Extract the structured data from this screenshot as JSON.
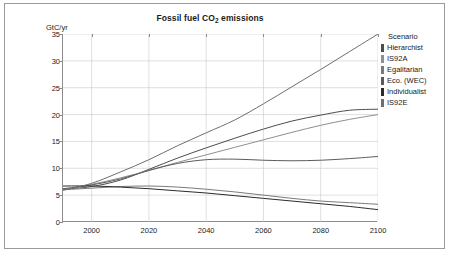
{
  "panel": {
    "border_color": "#9a9a9a",
    "background": "#ffffff"
  },
  "title": "Fossil fuel CO2 emissions",
  "title_main": "Fossil fuel CO",
  "title_sub": "2",
  "title_tail": " emissions",
  "ylabel": "GtC/yr",
  "legend": {
    "header": "Scenario",
    "items": [
      {
        "label": "Hierarchist",
        "color": "#4d4d4d"
      },
      {
        "label": "IS92A",
        "color": "#8f8f8f"
      },
      {
        "label": "Egalitarian",
        "color": "#7a7a7a"
      },
      {
        "label": "Eco. (WEC)",
        "color": "#5c5c5c"
      },
      {
        "label": "Individualist",
        "color": "#2b2b2b"
      },
      {
        "label": "IS92E",
        "color": "#6e6e6e"
      }
    ]
  },
  "chart_data": {
    "type": "line",
    "title": "Fossil fuel CO2 emissions",
    "xlabel": "",
    "ylabel": "GtC/yr",
    "xlim": [
      1990,
      2100
    ],
    "ylim": [
      0,
      35
    ],
    "grid": true,
    "legend_position": "right",
    "legend_title": "Scenario",
    "xticks": [
      2000,
      2020,
      2040,
      2060,
      2080,
      2100
    ],
    "yticks": [
      0,
      5,
      10,
      15,
      20,
      25,
      30,
      35
    ],
    "x": [
      1990,
      2000,
      2010,
      2020,
      2030,
      2040,
      2050,
      2060,
      2070,
      2080,
      2090,
      2100
    ],
    "series": [
      {
        "name": "Hierarchist",
        "color": "#4d4d4d",
        "values": [
          6.1,
          6.6,
          7.8,
          9.8,
          11.9,
          13.8,
          15.6,
          17.3,
          18.8,
          19.9,
          20.8,
          21.0
        ]
      },
      {
        "name": "IS92A",
        "color": "#8f8f8f",
        "values": [
          6.0,
          7.0,
          8.2,
          9.6,
          11.1,
          12.5,
          13.9,
          15.3,
          16.7,
          18.0,
          19.1,
          20.0
        ]
      },
      {
        "name": "Egalitarian",
        "color": "#7a7a7a",
        "values": [
          6.0,
          6.3,
          6.6,
          6.7,
          6.5,
          6.1,
          5.6,
          5.0,
          4.4,
          3.9,
          3.6,
          3.3
        ]
      },
      {
        "name": "Eco. (WEC)",
        "color": "#5c5c5c",
        "values": [
          6.2,
          6.9,
          8.0,
          9.6,
          10.9,
          11.6,
          11.7,
          11.5,
          11.4,
          11.5,
          11.8,
          12.2
        ]
      },
      {
        "name": "Individualist",
        "color": "#2b2b2b",
        "values": [
          6.7,
          6.7,
          6.5,
          6.2,
          5.8,
          5.4,
          4.9,
          4.4,
          3.9,
          3.4,
          2.9,
          2.3
        ]
      },
      {
        "name": "IS92E",
        "color": "#6e6e6e",
        "values": [
          5.9,
          7.2,
          9.3,
          11.6,
          14.2,
          16.6,
          19.0,
          22.0,
          25.2,
          28.4,
          31.7,
          35.0
        ]
      }
    ]
  }
}
